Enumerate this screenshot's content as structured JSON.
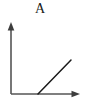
{
  "figure": {
    "panel_label": "A",
    "background_color": "#ffffff",
    "width_px": 86,
    "height_px": 105
  },
  "axes": {
    "color": "#555555",
    "line_width": 1.6,
    "origin": {
      "x": 11,
      "y": 94
    },
    "y_axis": {
      "name": "y-axis",
      "from": {
        "x": 11,
        "y": 94
      },
      "to": {
        "x": 11,
        "y": 22
      },
      "arrowhead": "up",
      "tick_labels": [],
      "title": ""
    },
    "x_axis": {
      "name": "x-axis",
      "from": {
        "x": 11,
        "y": 94
      },
      "to": {
        "x": 80,
        "y": 94
      },
      "arrowhead": "right",
      "tick_labels": [],
      "title": ""
    }
  },
  "chart_data": {
    "type": "line",
    "title": "A",
    "xlabel": "",
    "ylabel": "",
    "grid": false,
    "legend": null,
    "xlim": [
      0,
      1
    ],
    "ylim": [
      0,
      1
    ],
    "annotations": [],
    "series": [
      {
        "name": "rising-line",
        "color": "#1a1a1a",
        "line_width": 1.5,
        "x": [
          0.39,
          0.87
        ],
        "y": [
          0.0,
          0.47
        ],
        "pixel_points": [
          {
            "x": 38,
            "y": 94
          },
          {
            "x": 71,
            "y": 60
          }
        ]
      }
    ]
  }
}
